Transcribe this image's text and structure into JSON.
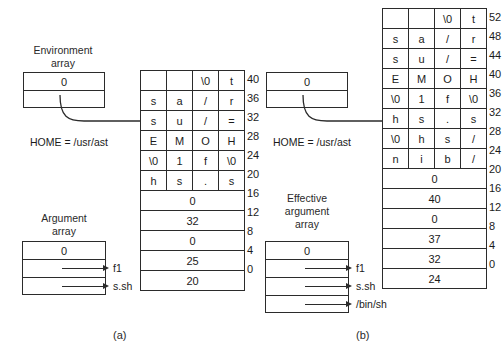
{
  "figure": {
    "label_a": "(a)",
    "label_b": "(b)"
  },
  "panel_a": {
    "env_array": {
      "title": "Environment\narray",
      "cells": [
        "0",
        ""
      ],
      "pointer_label": "HOME = /usr/ast"
    },
    "arg_array": {
      "title": "Argument\narray",
      "cells": [
        "0",
        "",
        ""
      ],
      "pointers": [
        "f1",
        "s.sh"
      ]
    },
    "memory": {
      "char_rows": [
        {
          "chars": [
            "",
            "",
            "\\0",
            "t"
          ],
          "offset": "40"
        },
        {
          "chars": [
            "s",
            "a",
            "/",
            "r"
          ],
          "offset": "36"
        },
        {
          "chars": [
            "s",
            "u",
            "/",
            "="
          ],
          "offset": "32"
        },
        {
          "chars": [
            "E",
            "M",
            "O",
            "H"
          ],
          "offset": "28"
        },
        {
          "chars": [
            "\\0",
            "1",
            "f",
            "\\0"
          ],
          "offset": "24"
        },
        {
          "chars": [
            "h",
            "s",
            ".",
            "s"
          ],
          "offset": "20"
        }
      ],
      "word_rows": [
        {
          "value": "0",
          "offset": "16"
        },
        {
          "value": "32",
          "offset": "12"
        },
        {
          "value": "0",
          "offset": "8"
        },
        {
          "value": "25",
          "offset": "4"
        },
        {
          "value": "20",
          "offset": "0"
        }
      ]
    }
  },
  "panel_b": {
    "env_array": {
      "cells": [
        "0",
        ""
      ],
      "pointer_label": "HOME = /usr/ast"
    },
    "eff_arg_array": {
      "title": "Effective\nargument\narray",
      "cells": [
        "0",
        "",
        "",
        ""
      ],
      "pointers": [
        "f1",
        "s.sh",
        "/bin/sh"
      ]
    },
    "memory": {
      "char_rows": [
        {
          "chars": [
            "",
            "",
            "\\0",
            "t"
          ],
          "offset": "52"
        },
        {
          "chars": [
            "s",
            "a",
            "/",
            "r"
          ],
          "offset": "48"
        },
        {
          "chars": [
            "s",
            "u",
            "/",
            "="
          ],
          "offset": "44"
        },
        {
          "chars": [
            "E",
            "M",
            "O",
            "H"
          ],
          "offset": "40"
        },
        {
          "chars": [
            "\\0",
            "1",
            "f",
            "\\0"
          ],
          "offset": "36"
        },
        {
          "chars": [
            "h",
            "s",
            ".",
            "s"
          ],
          "offset": "32"
        },
        {
          "chars": [
            "\\0",
            "h",
            "s",
            "/"
          ],
          "offset": "28"
        },
        {
          "chars": [
            "n",
            "i",
            "b",
            "/"
          ],
          "offset": "24"
        }
      ],
      "word_rows": [
        {
          "value": "0",
          "offset": "20"
        },
        {
          "value": "40",
          "offset": "16"
        },
        {
          "value": "0",
          "offset": "12"
        },
        {
          "value": "37",
          "offset": "8"
        },
        {
          "value": "32",
          "offset": "4"
        },
        {
          "value": "24",
          "offset": "0"
        }
      ]
    }
  },
  "colors": {
    "ink": "#1b1b1b",
    "rule": "#2b2b2b",
    "background": "#ffffff"
  }
}
